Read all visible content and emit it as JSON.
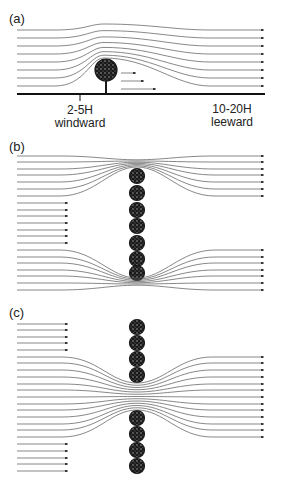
{
  "figure": {
    "colors": {
      "stroke": "#555555",
      "dark": "#111111",
      "ground": "#111111",
      "tree": "#1a1a1a"
    },
    "panels": [
      {
        "id": "a",
        "label": "(a)",
        "label_pos": [
          9,
          12
        ],
        "description": "Wind flow over a single tree; sheltered zone leeward",
        "ground": {
          "y": 94,
          "x1": 17,
          "x2": 265
        },
        "tick": {
          "x": 80,
          "y1": 94,
          "y2": 101
        },
        "annotations": [
          {
            "text": "2-5H",
            "x": 80,
            "y": 104
          },
          {
            "text": "windward",
            "x": 80,
            "y": 117
          },
          {
            "text": "10-20H",
            "x": 232,
            "y": 103
          },
          {
            "text": "leeward",
            "x": 232,
            "y": 116
          }
        ],
        "tree": {
          "cx": 106,
          "cy": 71,
          "r": 11,
          "trunk_bottom": 94
        },
        "streamlines_start_y": [
          30,
          38,
          46,
          54,
          62,
          70,
          78,
          86
        ],
        "streamlines_end_y": [
          30,
          38,
          46,
          54,
          62,
          70,
          78,
          86
        ],
        "small_arrows": [
          {
            "x1": 121,
            "x2": 136,
            "y": 73
          },
          {
            "x1": 121,
            "x2": 144,
            "y": 81
          },
          {
            "x1": 121,
            "x2": 156,
            "y": 89
          }
        ]
      },
      {
        "id": "b",
        "label": "(b)",
        "label_pos": [
          9,
          140
        ],
        "description": "Single continuous windbreak row; flow diverted around ends",
        "trees": {
          "cx": 137,
          "cy": [
            176,
            193,
            210,
            226,
            243,
            259,
            273
          ],
          "r": 7.5
        },
        "top_streamlines_y": [
          156,
          162,
          169,
          175,
          182,
          189,
          196
        ],
        "top_converge": [
          137,
          167
        ],
        "bottom_streamlines_y": [
          250,
          257,
          263,
          270,
          276,
          283,
          290
        ],
        "bottom_converge": [
          137,
          278
        ],
        "short_arrows_y": [
          203,
          210,
          216,
          223,
          230,
          236,
          243
        ],
        "short_arrow_x": [
          17,
          68
        ]
      },
      {
        "id": "c",
        "label": "(c)",
        "label_pos": [
          9,
          306
        ],
        "description": "Windbreak with a gap; flow funnels through the gap",
        "trees": {
          "cx": 137,
          "cy": [
            327,
            343,
            359,
            375,
            418,
            434,
            450,
            466
          ],
          "r": 7.5
        },
        "gap": [
          383,
          410
        ],
        "streamlines_y": [
          357,
          363,
          370,
          377,
          384,
          390,
          397,
          404,
          410,
          417,
          424,
          430,
          437
        ],
        "short_arrows_top_y": [
          324,
          330,
          337,
          343,
          350
        ],
        "short_arrows_bottom_y": [
          444,
          451,
          458,
          464,
          471
        ],
        "short_arrow_x": [
          17,
          68
        ]
      }
    ],
    "x_start": 17,
    "x_end": 264
  }
}
